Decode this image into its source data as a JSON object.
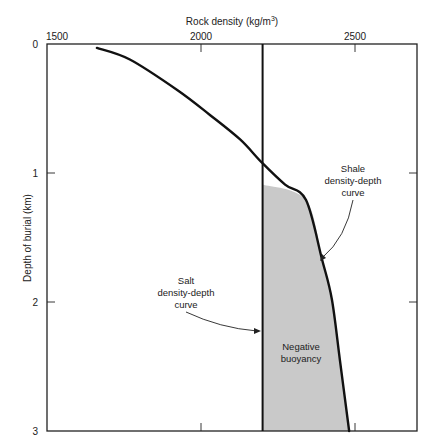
{
  "chart_data": {
    "type": "line",
    "title": "",
    "xlabel": "Rock density (kg/m³)",
    "xlabel_parts": {
      "main": "Rock density (kg/m",
      "sup": "3",
      "end": ")"
    },
    "ylabel": "Depth of burial (km)",
    "x_axis_position": "top",
    "y_inverted": true,
    "xlim": [
      1500,
      2700
    ],
    "ylim": [
      0,
      3
    ],
    "x_ticks": [
      1500,
      2000,
      2500
    ],
    "x_tick_labels": [
      "1500",
      "2000",
      "2500"
    ],
    "y_ticks": [
      0,
      1,
      2,
      3
    ],
    "y_tick_labels": [
      "0",
      "1",
      "2",
      "3"
    ],
    "grid": false,
    "series": [
      {
        "name": "Shale density-depth curve",
        "density": [
          1662,
          1769,
          1925,
          2029,
          2127,
          2198,
          2273,
          2341,
          2393,
          2425,
          2451,
          2481
        ],
        "depth": [
          0.03,
          0.12,
          0.36,
          0.55,
          0.74,
          0.92,
          1.09,
          1.21,
          1.67,
          1.98,
          2.45,
          3.0
        ]
      },
      {
        "name": "Salt density-depth curve",
        "density": [
          2200,
          2200
        ],
        "depth": [
          0,
          3
        ]
      }
    ],
    "shaded_region": {
      "label": "Negative buoyancy",
      "description": "Area between salt line and shale curve below ~0.92 km where shale is denser than salt",
      "color": "#c9c9c9"
    },
    "annotations": [
      {
        "lines": [
          "Shale",
          "density-depth",
          "curve"
        ],
        "points_to": "shale curve at ~1.4 km"
      },
      {
        "lines": [
          "Salt",
          "density-depth",
          "curve"
        ],
        "points_to": "salt line at ~2.2 km"
      },
      {
        "lines": [
          "Negative",
          "buoyancy"
        ],
        "inside": "shaded region"
      }
    ]
  }
}
